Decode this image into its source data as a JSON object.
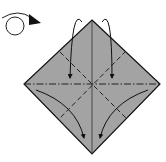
{
  "diagram": {
    "type": "origami-fold-diagram",
    "colors": {
      "paper_fill": "#a3a3a3",
      "outline": "#111111",
      "crease": "#222222",
      "background": "#ffffff"
    },
    "symbols": {
      "turn_over": "turn-over-icon",
      "arrows": [
        "fold-arrow-top-left",
        "fold-arrow-top-right",
        "fold-arrow-bottom-left",
        "fold-arrow-bottom-right"
      ]
    },
    "lines": {
      "horizontal": "mountain-fold (dash-dot)",
      "vertical": "solid crease",
      "diagonals": "valley-fold (dashed)"
    }
  }
}
